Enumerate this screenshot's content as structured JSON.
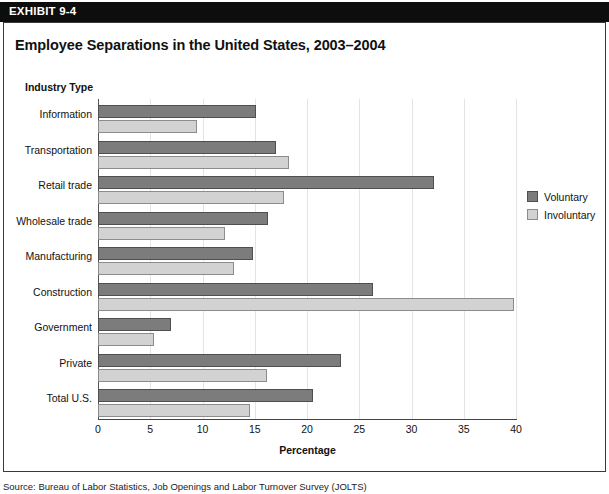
{
  "exhibit": {
    "tab_label": "EXHIBIT 9-4"
  },
  "chart_title": "Employee Separations in the United States, 2003–2004",
  "source_note": "Source: Bureau of Labor Statistics, Job Openings and Labor Turnover Survey (JOLTS)",
  "legend": {
    "items": [
      {
        "label": "Voluntary",
        "color": "#7c7c7c",
        "icon": "legend-swatch-icon"
      },
      {
        "label": "Involuntary",
        "color": "#d2d2d2",
        "icon": "legend-swatch-icon"
      }
    ]
  },
  "chart_data": {
    "type": "bar",
    "orientation": "horizontal",
    "title": "Employee Separations in the United States, 2003–2004",
    "xlabel": "Percentage",
    "ylabel": "Industry Type",
    "xlim": [
      0,
      40
    ],
    "xticks": [
      0,
      5,
      10,
      15,
      20,
      25,
      30,
      35,
      40
    ],
    "grid": true,
    "grid_axis": "x",
    "legend_position": "right",
    "categories": [
      "Information",
      "Transportation",
      "Retail trade",
      "Wholesale trade",
      "Manufacturing",
      "Construction",
      "Government",
      "Private",
      "Total U.S."
    ],
    "series": [
      {
        "name": "Voluntary",
        "color": "#7c7c7c",
        "values": [
          15.1,
          17.0,
          32.2,
          16.3,
          14.8,
          26.3,
          7.0,
          23.3,
          20.6
        ]
      },
      {
        "name": "Involuntary",
        "color": "#d2d2d2",
        "values": [
          9.5,
          18.3,
          17.8,
          12.2,
          13.0,
          39.8,
          5.4,
          16.2,
          14.5
        ]
      }
    ]
  }
}
